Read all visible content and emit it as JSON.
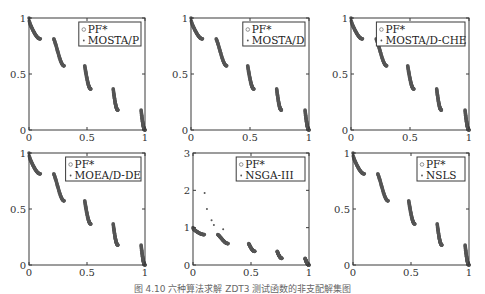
{
  "caption": "图 4.10  六种算法求解 ZDT3 测试函数的非支配解集图",
  "colors": {
    "axis": "#3a3a3a",
    "points": "#555555",
    "pf": "#777777"
  },
  "chart_data": [
    {
      "type": "scatter",
      "title": "",
      "legend": [
        "PF*",
        "MOSTA/P"
      ],
      "legend_position": "upper right",
      "xlim": [
        0,
        1
      ],
      "ylim": [
        0,
        1
      ],
      "xticks": [
        "0",
        "0.5",
        "1"
      ],
      "yticks": [
        "0",
        "0.5",
        "1"
      ],
      "outliers": []
    },
    {
      "type": "scatter",
      "title": "",
      "legend": [
        "PF*",
        "MOSTA/D"
      ],
      "legend_position": "upper right",
      "xlim": [
        0,
        1
      ],
      "ylim": [
        0,
        1
      ],
      "xticks": [
        "0",
        "0.5",
        "1"
      ],
      "yticks": [
        "0",
        "0.5",
        "1"
      ],
      "outliers": []
    },
    {
      "type": "scatter",
      "title": "",
      "legend": [
        "PF*",
        "MOSTA/D-CHE"
      ],
      "legend_position": "upper right",
      "xlim": [
        0,
        1
      ],
      "ylim": [
        0,
        1
      ],
      "xticks": [
        "0",
        "0.5",
        "1"
      ],
      "yticks": [
        "0",
        "0.5",
        "1"
      ],
      "outliers": []
    },
    {
      "type": "scatter",
      "title": "",
      "legend": [
        "PF*",
        "MOEA/D-DE"
      ],
      "legend_position": "upper right",
      "xlim": [
        0,
        1
      ],
      "ylim": [
        0,
        1
      ],
      "xticks": [
        "0",
        "0.5",
        "1"
      ],
      "yticks": [
        "0",
        "0.5",
        "1"
      ],
      "outliers": []
    },
    {
      "type": "scatter",
      "title": "",
      "legend": [
        "PF*",
        "NSGA-III"
      ],
      "legend_position": "upper right",
      "xlim": [
        0,
        1
      ],
      "ylim": [
        0,
        3
      ],
      "xticks": [
        "0",
        "0.5",
        "1"
      ],
      "yticks": [
        "0",
        "1",
        "2",
        "3"
      ],
      "outliers": [
        [
          0.1,
          1.93
        ],
        [
          0.12,
          1.5
        ],
        [
          0.16,
          1.2
        ],
        [
          0.18,
          1.07
        ],
        [
          0.26,
          0.96
        ]
      ]
    },
    {
      "type": "scatter",
      "title": "",
      "legend": [
        "PF*",
        "NSLS"
      ],
      "legend_position": "upper right",
      "xlim": [
        0,
        1
      ],
      "ylim": [
        0,
        1
      ],
      "xticks": [
        "0",
        "0.5",
        "1"
      ],
      "yticks": [
        "0",
        "0.5",
        "1"
      ],
      "outliers": []
    }
  ],
  "front_segments": [
    {
      "x_start": 0.0,
      "x_end": 0.083,
      "y_start": 1.0,
      "y_end": 0.44
    },
    {
      "x_start": 0.33,
      "x_end": 0.38,
      "y_start": 0.44,
      "y_end": 0.31
    },
    {
      "x_start": 0.58,
      "x_end": 0.63,
      "y_start": 0.31,
      "y_end": 0.18
    },
    {
      "x_start": 0.82,
      "x_end": 0.87,
      "y_start": 0.19,
      "y_end": 0.06
    },
    {
      "x_start": 0.995,
      "x_end": 1.0,
      "y_start": 0.08,
      "y_end": 0.0
    }
  ]
}
